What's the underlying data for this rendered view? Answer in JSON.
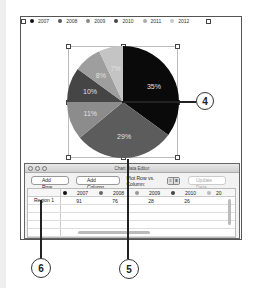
{
  "legend": {
    "items": [
      {
        "label": "2007",
        "color": "#111111"
      },
      {
        "label": "2008",
        "color": "#555555"
      },
      {
        "label": "2009",
        "color": "#888888"
      },
      {
        "label": "2010",
        "color": "#444444"
      },
      {
        "label": "2011",
        "color": "#aaaaaa"
      },
      {
        "label": "2012",
        "color": "#c8c8c8"
      }
    ]
  },
  "chart_data": {
    "type": "pie",
    "title": "",
    "categories": [
      "2007",
      "2008",
      "2009",
      "2010",
      "2011",
      "2012"
    ],
    "values": [
      35,
      29,
      11,
      10,
      8,
      7
    ],
    "labels": [
      "35%",
      "29%",
      "11%",
      "10%",
      "8%",
      "7%"
    ],
    "colors": [
      "#0a0a0a",
      "#5c5c5c",
      "#8c8c8c",
      "#454545",
      "#9e9e9e",
      "#c4c4c4"
    ],
    "legend_position": "top"
  },
  "callouts": {
    "c4": "4",
    "c5": "5",
    "c6": "6"
  },
  "editor": {
    "title": "Chart Data Editor",
    "add_row": "Add Row",
    "add_column": "Add Column",
    "plot_label": "Plot Row vs. Column:",
    "update_data": "Update Data",
    "columns": [
      "2007",
      "2008",
      "2009",
      "2010",
      "20"
    ],
    "column_colors": [
      "#111111",
      "#666666",
      "#999999",
      "#444444",
      "#bbbbbb"
    ],
    "rows": [
      {
        "label": "Region 1",
        "values": [
          "91",
          "76",
          "28",
          "26",
          ""
        ]
      }
    ]
  }
}
